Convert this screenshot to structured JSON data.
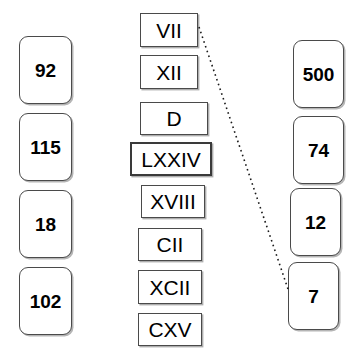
{
  "canvas": {
    "width": 361,
    "height": 358,
    "background": "#ffffff"
  },
  "left_column": {
    "name": "arabic-numbers-left",
    "items": [
      {
        "label": "92",
        "x": 19,
        "y": 36,
        "w": 53,
        "h": 68
      },
      {
        "label": "115",
        "x": 19,
        "y": 113,
        "w": 53,
        "h": 68
      },
      {
        "label": "18",
        "x": 19,
        "y": 190,
        "w": 53,
        "h": 68
      },
      {
        "label": "102",
        "x": 19,
        "y": 267,
        "w": 53,
        "h": 68
      }
    ]
  },
  "middle_column": {
    "name": "roman-numerals",
    "items": [
      {
        "label": "VII",
        "x": 140,
        "y": 13,
        "w": 58,
        "h": 34,
        "emphasis": false
      },
      {
        "label": "XII",
        "x": 140,
        "y": 55,
        "w": 58,
        "h": 34,
        "emphasis": false
      },
      {
        "label": "D",
        "x": 140,
        "y": 102,
        "w": 68,
        "h": 33,
        "emphasis": false
      },
      {
        "label": "LXXIV",
        "x": 130,
        "y": 142,
        "w": 82,
        "h": 34,
        "emphasis": true
      },
      {
        "label": "XVIII",
        "x": 141,
        "y": 185,
        "w": 64,
        "h": 33,
        "emphasis": false
      },
      {
        "label": "CII",
        "x": 138,
        "y": 228,
        "w": 64,
        "h": 33,
        "emphasis": false
      },
      {
        "label": "XCII",
        "x": 138,
        "y": 270,
        "w": 64,
        "h": 34,
        "emphasis": false
      },
      {
        "label": "CXV",
        "x": 138,
        "y": 313,
        "w": 64,
        "h": 33,
        "emphasis": false
      }
    ]
  },
  "right_column": {
    "name": "arabic-numbers-right",
    "items": [
      {
        "label": "500",
        "x": 293,
        "y": 40,
        "w": 51,
        "h": 68
      },
      {
        "label": "74",
        "x": 293,
        "y": 116,
        "w": 51,
        "h": 68
      },
      {
        "label": "12",
        "x": 290,
        "y": 188,
        "w": 51,
        "h": 68
      },
      {
        "label": "7",
        "x": 288,
        "y": 262,
        "w": 51,
        "h": 68
      }
    ]
  },
  "connections": [
    {
      "name": "connector-vii-to-7",
      "from": "VII",
      "to": "7",
      "x1": 199,
      "y1": 27,
      "x2": 288,
      "y2": 289,
      "color": "#1a1a1a",
      "style": "dotted"
    }
  ]
}
